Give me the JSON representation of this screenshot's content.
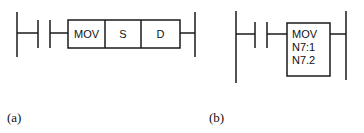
{
  "diagram_a": {
    "caption": "(a)",
    "instruction": {
      "mnemonic": "MOV",
      "source": "S",
      "destination": "D"
    }
  },
  "diagram_b": {
    "caption": "(b)",
    "instruction": {
      "mnemonic": "MOV",
      "source": "N7:1",
      "destination": "N7.2"
    }
  },
  "colors": {
    "line": "#1a1a1a",
    "background": "#ffffff"
  }
}
